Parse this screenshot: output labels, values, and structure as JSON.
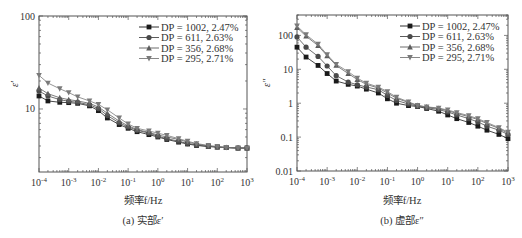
{
  "chart_data": [
    {
      "id": "a",
      "type": "line",
      "title": "",
      "caption": "(a) 实部ε′",
      "xlabel": "频率f/Hz",
      "ylabel": "ε′",
      "xscale": "log",
      "yscale": "log",
      "xlim": [
        0.0001,
        1000
      ],
      "ylim": [
        2.1,
        100
      ],
      "xticks": [
        "10^-4",
        "10^-3",
        "10^-2",
        "10^-1",
        "10^0",
        "10^1",
        "10^2",
        "10^3"
      ],
      "yticks": [
        "10",
        "100"
      ],
      "grid": false,
      "legend_position": "upper right",
      "x": [
        0.0001,
        0.0002,
        0.0005,
        0.001,
        0.002,
        0.005,
        0.01,
        0.02,
        0.05,
        0.1,
        0.2,
        0.5,
        1,
        2,
        5,
        10,
        20,
        50,
        100,
        200,
        500,
        1000
      ],
      "series": [
        {
          "name": "DP = 1002, 2.47%",
          "marker": "square",
          "values": [
            13.8,
            12.2,
            11.8,
            11.7,
            11.5,
            10.8,
            9.6,
            8.0,
            6.8,
            6.2,
            5.7,
            5.3,
            5.0,
            4.7,
            4.4,
            4.2,
            4.05,
            3.95,
            3.9,
            3.85,
            3.8,
            3.8
          ]
        },
        {
          "name": "DP = 611, 2.63%",
          "marker": "circle",
          "values": [
            15.6,
            13.8,
            12.6,
            12.1,
            11.8,
            11.1,
            10.1,
            8.5,
            7.1,
            6.4,
            5.9,
            5.5,
            5.1,
            4.8,
            4.5,
            4.25,
            4.1,
            3.95,
            3.9,
            3.85,
            3.8,
            3.8
          ]
        },
        {
          "name": "DP = 356, 2.68%",
          "marker": "triangle-up",
          "values": [
            16.8,
            14.6,
            13.2,
            12.6,
            12.2,
            11.5,
            10.5,
            9.0,
            7.4,
            6.6,
            6.0,
            5.6,
            5.25,
            5.0,
            4.7,
            4.4,
            4.2,
            4.0,
            3.9,
            3.85,
            3.8,
            3.8
          ]
        },
        {
          "name": "DP = 295, 2.71%",
          "marker": "triangle-down",
          "values": [
            23.0,
            19.0,
            16.5,
            15.0,
            13.5,
            12.2,
            11.2,
            9.8,
            8.0,
            6.9,
            6.2,
            5.8,
            5.5,
            5.2,
            4.8,
            4.5,
            4.25,
            4.05,
            3.95,
            3.85,
            3.8,
            3.8
          ]
        }
      ]
    },
    {
      "id": "b",
      "type": "line",
      "title": "",
      "caption": "(b) 虚部ε″",
      "xlabel": "频率f/Hz",
      "ylabel": "ε″",
      "xscale": "log",
      "yscale": "log",
      "xlim": [
        0.0001,
        1000
      ],
      "ylim": [
        0.01,
        400
      ],
      "xticks": [
        "10^-4",
        "10^-3",
        "10^-2",
        "10^-1",
        "10^0",
        "10^1",
        "10^2",
        "10^3"
      ],
      "yticks": [
        "0.01",
        "0.1",
        "1",
        "10",
        "100"
      ],
      "grid": false,
      "legend_position": "upper right",
      "x": [
        0.0001,
        0.0002,
        0.0005,
        0.001,
        0.002,
        0.005,
        0.01,
        0.02,
        0.05,
        0.1,
        0.2,
        0.5,
        1,
        2,
        5,
        10,
        20,
        50,
        100,
        200,
        500,
        1000
      ],
      "series": [
        {
          "name": "DP = 1002, 2.47%",
          "marker": "square",
          "values": [
            45,
            23,
            13,
            7.5,
            4.5,
            3.6,
            3.2,
            2.6,
            2.0,
            1.35,
            1.0,
            0.85,
            0.8,
            0.7,
            0.58,
            0.45,
            0.35,
            0.27,
            0.21,
            0.16,
            0.12,
            0.09
          ]
        },
        {
          "name": "DP = 611, 2.63%",
          "marker": "circle",
          "values": [
            90,
            45,
            24,
            12.5,
            6.5,
            4.2,
            3.5,
            3.0,
            2.5,
            1.7,
            1.2,
            0.95,
            0.82,
            0.74,
            0.65,
            0.55,
            0.45,
            0.35,
            0.28,
            0.21,
            0.16,
            0.12
          ]
        },
        {
          "name": "DP = 356, 2.68%",
          "marker": "triangle-up",
          "values": [
            170,
            95,
            50,
            25,
            13,
            7.5,
            5.0,
            3.6,
            2.8,
            2.0,
            1.4,
            1.05,
            0.85,
            0.77,
            0.7,
            0.6,
            0.5,
            0.4,
            0.33,
            0.25,
            0.18,
            0.13
          ]
        },
        {
          "name": "DP = 295, 2.71%",
          "marker": "triangle-down",
          "values": [
            190,
            105,
            55,
            27,
            14,
            8.5,
            5.5,
            3.9,
            3.0,
            2.2,
            1.5,
            1.1,
            0.86,
            0.78,
            0.72,
            0.63,
            0.53,
            0.43,
            0.35,
            0.27,
            0.19,
            0.14
          ]
        }
      ]
    }
  ],
  "panels": {
    "a": {
      "caption": "(a) 实部ε′",
      "xlabel": "频率f/Hz",
      "ylabel": "ε′"
    },
    "b": {
      "caption": "(b) 虚部ε″",
      "xlabel": "频率f/Hz",
      "ylabel": "ε″"
    }
  },
  "colors": {
    "axis": "#555555",
    "series": [
      "#1a1a1a",
      "#4a4a4a",
      "#5c5c5c",
      "#7a7a7a"
    ]
  }
}
